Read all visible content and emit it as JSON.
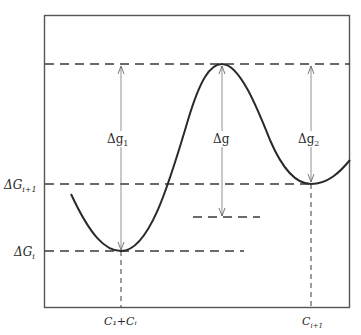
{
  "diagram": {
    "type": "energy-profile",
    "y_labels": {
      "dG_i1_main": "ΔG",
      "dG_i1_sub": "i+1",
      "dG_i_main": "ΔG",
      "dG_i_sub": "i"
    },
    "x_labels": {
      "c1ci": "C₁+Cᵢ",
      "ci1_main": "C",
      "ci1_sub": "i+1"
    },
    "arrow_labels": {
      "dg1_main": "Δg",
      "dg1_sub": "1",
      "dg_main": "Δg",
      "dg2_main": "Δg",
      "dg2_sub": "2"
    },
    "colors": {
      "line": "#2a2a2a",
      "dash": "#3a3a3a",
      "frame": "#555555"
    }
  }
}
